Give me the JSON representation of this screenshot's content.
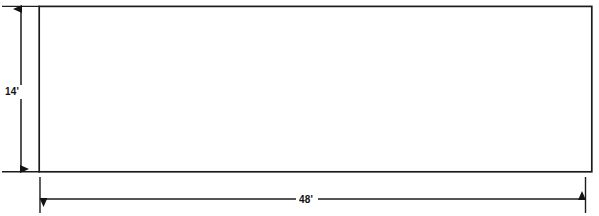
{
  "drawing": {
    "type": "dimensioned-rectangle",
    "background_color": "#ffffff",
    "line_color": "#1a1a1a",
    "fill_color": "#ffffff",
    "shape": {
      "name": "rectangle",
      "left": 39,
      "top": 6,
      "right": 592,
      "bottom": 172,
      "stroke_width": 1.6
    },
    "dimensions": {
      "vertical": {
        "label": "14'",
        "value": 14,
        "unit": "feet",
        "axis": "vertical",
        "line_x": 21,
        "start_y": 6,
        "end_y": 172,
        "label_x": 12,
        "label_y": 95,
        "arrow_style": "double"
      },
      "horizontal": {
        "label": "48'",
        "value": 48,
        "unit": "feet",
        "axis": "horizontal",
        "line_y": 199,
        "start_x": 40,
        "end_x": 585,
        "label_x": 306,
        "label_y": 203,
        "arrow_style": "double"
      }
    },
    "extension_lines": [
      {
        "name": "top-left-extension",
        "x1": 2,
        "y1": 6,
        "x2": 40,
        "y2": 6
      },
      {
        "name": "bottom-left-extension",
        "x1": 2,
        "y1": 172,
        "x2": 40,
        "y2": 172
      },
      {
        "name": "left-vertical-extension",
        "x1": 40,
        "y1": 176,
        "x2": 40,
        "y2": 213
      },
      {
        "name": "right-vertical-extension",
        "x1": 585,
        "y1": 176,
        "x2": 585,
        "y2": 213
      }
    ]
  }
}
